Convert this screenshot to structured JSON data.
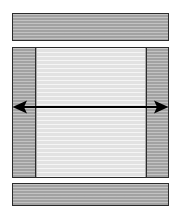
{
  "figure": {
    "type": "engineering-cross-section-diagram",
    "canvas": {
      "width": 181,
      "height": 214,
      "background": "#ffffff"
    },
    "palette": {
      "hatched_gray": "#a9a9a9",
      "light_cavity": "#e9e9e9",
      "outline": "#2b2b2b",
      "arrow": "#000000",
      "background": "#ffffff"
    },
    "parts": [
      {
        "name": "top-bar",
        "role": "upper horizontal member",
        "fill": "hatched-gray",
        "x": 12,
        "y": 13,
        "width": 157,
        "height": 28,
        "label": ""
      },
      {
        "name": "main-body",
        "role": "central body with two hatched side columns and light interior cavity",
        "x": 12,
        "y": 47,
        "width": 157,
        "height": 131,
        "label": "",
        "children": [
          {
            "name": "left-column",
            "fill": "hatched-gray",
            "width": 23,
            "label": ""
          },
          {
            "name": "center-panel",
            "fill": "light",
            "width": 108,
            "label": ""
          },
          {
            "name": "right-column",
            "fill": "hatched-gray",
            "width": 22,
            "label": ""
          }
        ]
      },
      {
        "name": "bottom-bar",
        "role": "lower horizontal member",
        "fill": "hatched-gray",
        "x": 12,
        "y": 183,
        "width": 157,
        "height": 23,
        "label": ""
      }
    ],
    "annotations": [
      {
        "name": "width-dimension-arrow",
        "style": "double-headed horizontal arrow",
        "color": "#000000",
        "from_x": 13,
        "to_x": 168,
        "y": 107,
        "label": ""
      }
    ]
  }
}
